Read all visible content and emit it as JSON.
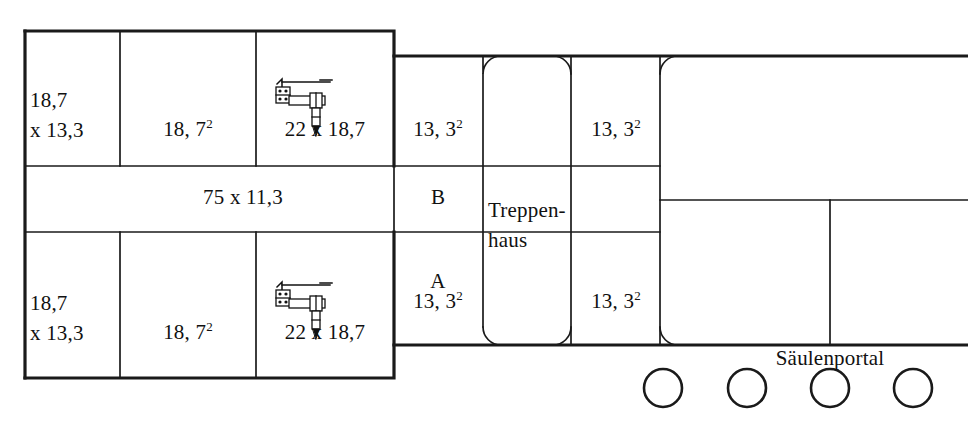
{
  "diagram": {
    "type": "architectural-floor-plan",
    "stroke_color": "#1a1a1a",
    "background_color": "#ffffff"
  },
  "rooms": {
    "top_left_1": {
      "line1": "18,7",
      "line2": "x 13,3"
    },
    "top_left_2": {
      "value": "18, 7",
      "exponent": "2"
    },
    "top_left_3": {
      "value": "22 x 18,7"
    },
    "top_right_1": {
      "value": "13, 3",
      "exponent": "2"
    },
    "top_right_2": {
      "value": "13, 3",
      "exponent": "2"
    },
    "corridor": {
      "value": "75 x 11,3"
    },
    "corridor_mark_b": {
      "value": "B"
    },
    "corridor_mark_a": {
      "value": "A"
    },
    "bottom_left_1": {
      "line1": "18,7",
      "line2": "x 13,3"
    },
    "bottom_left_2": {
      "value": "18, 7",
      "exponent": "2"
    },
    "bottom_left_3": {
      "value": "22 x 18,7"
    },
    "bottom_right_1": {
      "value": "13, 3",
      "exponent": "2"
    },
    "bottom_right_2": {
      "value": "13, 3",
      "exponent": "2"
    },
    "stairwell": {
      "line1": "Treppen-",
      "line2": "haus"
    },
    "portal": {
      "value": "Säulenportal"
    }
  },
  "columns": {
    "count": 4,
    "radius": 19,
    "centers_x": [
      663,
      747,
      830,
      913
    ],
    "center_y": 388
  },
  "symbols": {
    "furniture_top": {
      "name": "desk-workstation-symbol"
    },
    "furniture_bottom": {
      "name": "desk-workstation-symbol"
    }
  }
}
